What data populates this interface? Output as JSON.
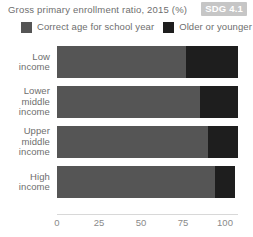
{
  "header": {
    "title": "Gross primary enrollment ratio, 2015 (%)",
    "badge": "SDG 4.1"
  },
  "legend": {
    "items": [
      {
        "label": "Correct age for school year",
        "color": "#555555",
        "swatch_name": "legend-swatch-correct-age"
      },
      {
        "label": "Older or younger",
        "color": "#1e1e1e",
        "swatch_name": "legend-swatch-older-younger"
      }
    ]
  },
  "colors": {
    "correct_age": "#555555",
    "older_or_younger": "#1e1e1e",
    "badge_bg": "#c6c6c6",
    "text": "#6e6e6e",
    "axis": "#d8d8d8"
  },
  "chart_data": {
    "type": "bar",
    "orientation": "horizontal",
    "stacked": true,
    "title": "Gross primary enrollment ratio, 2015 (%)",
    "xlabel": "",
    "ylabel": "",
    "xlim": [
      0,
      110
    ],
    "xticks": [
      0,
      25,
      50,
      75,
      100
    ],
    "xtick_labels": [
      "0",
      "25",
      "50",
      "75",
      "100"
    ],
    "grid": false,
    "legend_position": "top-left",
    "categories": [
      "Low income",
      "Lower middle income",
      "Upper middle income",
      "High income"
    ],
    "category_lines": [
      [
        "Low",
        "income"
      ],
      [
        "Lower",
        "middle",
        "income"
      ],
      [
        "Upper",
        "middle",
        "income"
      ],
      [
        "High",
        "income"
      ]
    ],
    "series": [
      {
        "name": "Correct age for school year",
        "values": [
          77,
          85,
          90,
          94
        ],
        "color": "#555555"
      },
      {
        "name": "Older or younger",
        "values": [
          31,
          23,
          18,
          12
        ],
        "color": "#1e1e1e"
      }
    ],
    "totals": [
      108,
      108,
      108,
      106
    ],
    "annotations": [
      "SDG 4.1"
    ]
  }
}
